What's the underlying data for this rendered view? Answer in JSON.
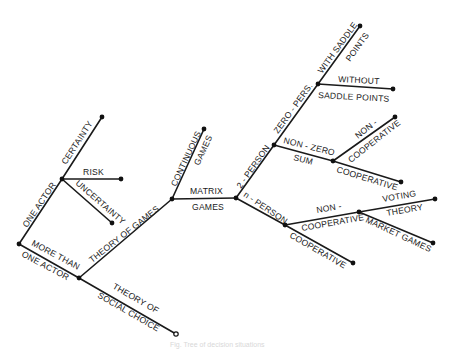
{
  "diagram": {
    "type": "tree",
    "title": "",
    "nodes": [
      {
        "id": "root",
        "x": 19,
        "y": 244,
        "kind": "branch"
      },
      {
        "id": "one_actor",
        "x": 62,
        "y": 179,
        "kind": "branch"
      },
      {
        "id": "certainty",
        "x": 102,
        "y": 117,
        "kind": "leaf"
      },
      {
        "id": "risk",
        "x": 121,
        "y": 179,
        "kind": "leaf"
      },
      {
        "id": "uncertainty",
        "x": 112,
        "y": 223,
        "kind": "leaf"
      },
      {
        "id": "more_than_one",
        "x": 79,
        "y": 278,
        "kind": "branch"
      },
      {
        "id": "social_choice",
        "x": 176,
        "y": 334,
        "kind": "open-leaf"
      },
      {
        "id": "theory_of_games",
        "x": 172,
        "y": 199,
        "kind": "branch"
      },
      {
        "id": "continuous_games",
        "x": 204,
        "y": 129,
        "kind": "leaf"
      },
      {
        "id": "matrix_games",
        "x": 236,
        "y": 198,
        "kind": "branch"
      },
      {
        "id": "two_person",
        "x": 274,
        "y": 145,
        "kind": "branch"
      },
      {
        "id": "zero_sum",
        "x": 318,
        "y": 84,
        "kind": "branch"
      },
      {
        "id": "with_saddle",
        "x": 360,
        "y": 26,
        "kind": "leaf"
      },
      {
        "id": "without_saddle",
        "x": 393,
        "y": 89,
        "kind": "leaf"
      },
      {
        "id": "non_zero_sum",
        "x": 333,
        "y": 161,
        "kind": "branch"
      },
      {
        "id": "nz_non_coop",
        "x": 395,
        "y": 117,
        "kind": "leaf"
      },
      {
        "id": "nz_coop",
        "x": 401,
        "y": 182,
        "kind": "leaf"
      },
      {
        "id": "n_person",
        "x": 285,
        "y": 225,
        "kind": "branch"
      },
      {
        "id": "n_non_coop",
        "x": 359,
        "y": 212,
        "kind": "branch"
      },
      {
        "id": "voting_theory",
        "x": 435,
        "y": 199,
        "kind": "leaf"
      },
      {
        "id": "market_games",
        "x": 433,
        "y": 243,
        "kind": "leaf"
      },
      {
        "id": "n_coop",
        "x": 353,
        "y": 263,
        "kind": "leaf"
      }
    ],
    "edges": [
      {
        "from": "root",
        "to": "one_actor"
      },
      {
        "from": "one_actor",
        "to": "certainty"
      },
      {
        "from": "one_actor",
        "to": "risk"
      },
      {
        "from": "one_actor",
        "to": "uncertainty"
      },
      {
        "from": "root",
        "to": "more_than_one"
      },
      {
        "from": "more_than_one",
        "to": "social_choice"
      },
      {
        "from": "more_than_one",
        "to": "theory_of_games"
      },
      {
        "from": "theory_of_games",
        "to": "continuous_games"
      },
      {
        "from": "theory_of_games",
        "to": "matrix_games"
      },
      {
        "from": "matrix_games",
        "to": "two_person"
      },
      {
        "from": "two_person",
        "to": "zero_sum"
      },
      {
        "from": "zero_sum",
        "to": "with_saddle"
      },
      {
        "from": "zero_sum",
        "to": "without_saddle"
      },
      {
        "from": "two_person",
        "to": "non_zero_sum"
      },
      {
        "from": "non_zero_sum",
        "to": "nz_non_coop"
      },
      {
        "from": "non_zero_sum",
        "to": "nz_coop"
      },
      {
        "from": "matrix_games",
        "to": "n_person"
      },
      {
        "from": "n_person",
        "to": "n_non_coop"
      },
      {
        "from": "n_non_coop",
        "to": "voting_theory"
      },
      {
        "from": "n_non_coop",
        "to": "market_games"
      },
      {
        "from": "n_person",
        "to": "n_coop"
      }
    ]
  },
  "labels": {
    "one_actor": "ONE  ACTOR",
    "certainty": "CERTAINTY",
    "risk": "RISK",
    "uncertainty": "UNCERTAINTY",
    "more_than_line1": "MORE  THAN",
    "more_than_line2": "ONE  ACTOR",
    "theory_of_games": "THEORY OF GAMES",
    "social_choice_line1": "THEORY OF",
    "social_choice_line2": "SOCIAL  CHOICE",
    "continuous_line1": "CONTINUOUS",
    "continuous_line2": "GAMES",
    "matrix_line1": "MATRIX",
    "matrix_line2": "GAMES",
    "two_person": "2 - PERSON",
    "zero_pers": "ZERO - PERS.",
    "with_saddle_line1": "WITH SADDLE",
    "with_saddle_line2": "POINTS",
    "without_line1": "WITHOUT",
    "without_line2": "SADDLE  POINTS",
    "non_zero_line1": "NON - ZERO",
    "non_zero_line2": "SUM",
    "nz_non_coop_line1": "NON -",
    "nz_non_coop_line2": "COOPERATIVE",
    "nz_coop": "COOPERATIVE",
    "n_person": "n - PERSON",
    "n_non_coop_line1": "NON -",
    "n_non_coop_line2": "COOPERATIVE",
    "voting_line1": "VOTING",
    "voting_line2": "THEORY",
    "market_games": "MARKET GAMES",
    "n_coop": "COOPERATIVE"
  },
  "caption": "Fig.    Tree of decision situations"
}
